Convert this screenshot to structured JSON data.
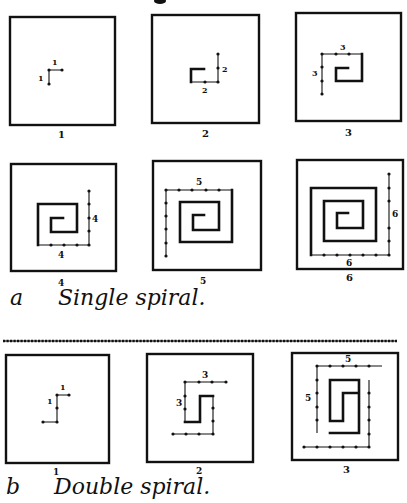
{
  "figure": {
    "section_a": {
      "letter": "a",
      "title": "Single spiral.",
      "panels": [
        {
          "number": "1",
          "segment_labels": [
            "1",
            "1"
          ]
        },
        {
          "number": "2",
          "segment_labels": [
            "2",
            "2"
          ]
        },
        {
          "number": "3",
          "segment_labels": [
            "3",
            "3"
          ]
        },
        {
          "number": "4",
          "segment_labels": [
            "4",
            "4"
          ]
        },
        {
          "number": "5",
          "segment_labels": [
            "5"
          ]
        },
        {
          "number": "6",
          "segment_labels": [
            "6",
            "6"
          ]
        }
      ]
    },
    "section_b": {
      "letter": "b",
      "title": "Double spiral.",
      "panels": [
        {
          "number": "1",
          "segment_labels": [
            "1",
            "1"
          ]
        },
        {
          "number": "2",
          "segment_labels": [
            "3",
            "3"
          ]
        },
        {
          "number": "3",
          "segment_labels": [
            "5",
            "5"
          ]
        }
      ]
    },
    "divider": "dotted-rule"
  }
}
